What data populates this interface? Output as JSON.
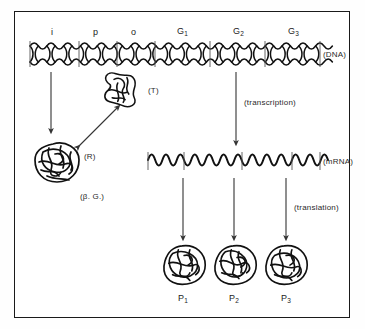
{
  "figure": {
    "background_color": "#ffffff",
    "border_color": "#1a1a1a"
  },
  "dna": {
    "row_label": "(DNA)",
    "genes": [
      {
        "id": "i",
        "label": "i"
      },
      {
        "id": "p",
        "label": "p"
      },
      {
        "id": "o",
        "label": "o"
      },
      {
        "id": "g1",
        "label": "G",
        "sub": "1"
      },
      {
        "id": "g2",
        "label": "G",
        "sub": "2"
      },
      {
        "id": "g3",
        "label": "G",
        "sub": "3"
      }
    ]
  },
  "mrna": {
    "row_label": "(mRNA)"
  },
  "molecules": {
    "inducer": "(T)",
    "repressor": "(R)",
    "beta_galactosidase": "(β. G.)"
  },
  "processes": {
    "transcription": "(transcription)",
    "translation": "(translation)"
  },
  "proteins": [
    {
      "id": "p1",
      "label": "P",
      "sub": "1"
    },
    {
      "id": "p2",
      "label": "P",
      "sub": "2"
    },
    {
      "id": "p3",
      "label": "P",
      "sub": "3"
    }
  ]
}
